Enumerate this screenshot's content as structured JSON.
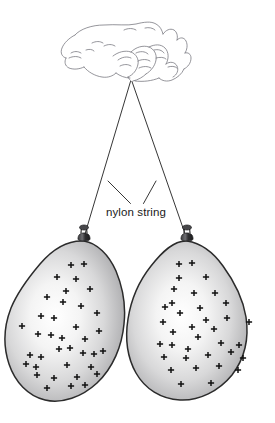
{
  "figure": {
    "name": "two-charged-balloons-hanging-from-hand",
    "background_color": "#ffffff",
    "width": 275,
    "height": 423,
    "annotation": {
      "label": "nylon string",
      "text_x": 106,
      "text_y": 216,
      "font_size": 11.5,
      "color": "#1a1a1a",
      "leader_lines": [
        {
          "x1": 108,
          "y1": 181,
          "x2": 130.5,
          "y2": 203.5
        },
        {
          "x1": 156,
          "y1": 181,
          "x2": 143.5,
          "y2": 203.5
        }
      ]
    },
    "hand": {
      "name": "hand-pinching-strings",
      "stroke_color": "#6e6e72",
      "stroke_width": 0.7,
      "pinch_point": {
        "x": 131,
        "y": 81
      }
    },
    "strings": {
      "name": "nylon-strings",
      "stroke_color": "#2b2b2b",
      "stroke_width": 0.9,
      "left": {
        "x1": 130.5,
        "y1": 81,
        "x2": 83,
        "y2": 239
      },
      "right": {
        "x1": 132,
        "y1": 81,
        "x2": 186,
        "y2": 238
      }
    },
    "balloons": [
      {
        "name": "balloon-left",
        "charge_sign": "+",
        "charge_count": 37,
        "outline_color": "#2b2b2b",
        "fill_light": "#fdfdfd",
        "fill_dark": "#8e8e90",
        "knot": {
          "x": 84,
          "y": 235
        },
        "center": {
          "x": 65,
          "y": 330
        },
        "charges": [
          [
            71,
            265
          ],
          [
            84,
            264
          ],
          [
            57,
            277
          ],
          [
            76,
            279
          ],
          [
            66,
            291
          ],
          [
            90,
            289
          ],
          [
            47,
            297
          ],
          [
            63,
            302
          ],
          [
            81,
            306
          ],
          [
            41,
            316
          ],
          [
            54,
            318
          ],
          [
            97,
            313
          ],
          [
            22,
            326
          ],
          [
            76,
            327
          ],
          [
            99,
            331
          ],
          [
            38,
            334
          ],
          [
            51,
            335
          ],
          [
            85,
            339
          ],
          [
            59,
            349
          ],
          [
            30,
            355
          ],
          [
            41,
            357
          ],
          [
            83,
            353
          ],
          [
            94,
            354
          ],
          [
            103,
            351
          ],
          [
            36,
            367
          ],
          [
            67,
            365
          ],
          [
            91,
            367
          ],
          [
            37,
            375
          ],
          [
            54,
            378
          ],
          [
            77,
            377
          ],
          [
            97,
            374
          ],
          [
            26,
            364
          ],
          [
            47,
            388
          ],
          [
            71,
            386
          ],
          [
            85,
            385
          ],
          [
            62,
            338
          ],
          [
            70,
            348
          ]
        ]
      },
      {
        "name": "balloon-right",
        "charge_sign": "+",
        "charge_count": 36,
        "outline_color": "#2b2b2b",
        "fill_light": "#fdfdfd",
        "fill_dark": "#8e8e90",
        "knot": {
          "x": 187,
          "y": 235
        },
        "center": {
          "x": 200,
          "y": 330
        },
        "charges": [
          [
            179,
            264
          ],
          [
            192,
            263
          ],
          [
            179,
            278
          ],
          [
            206,
            277
          ],
          [
            174,
            289
          ],
          [
            194,
            293
          ],
          [
            172,
            303
          ],
          [
            215,
            293
          ],
          [
            165,
            307
          ],
          [
            200,
            308
          ],
          [
            226,
            303
          ],
          [
            180,
            313
          ],
          [
            163,
            322
          ],
          [
            206,
            320
          ],
          [
            192,
            327
          ],
          [
            227,
            318
          ],
          [
            173,
            332
          ],
          [
            198,
            337
          ],
          [
            214,
            329
          ],
          [
            249,
            322
          ],
          [
            160,
            344
          ],
          [
            172,
            345
          ],
          [
            188,
            349
          ],
          [
            221,
            343
          ],
          [
            239,
            345
          ],
          [
            164,
            357
          ],
          [
            186,
            358
          ],
          [
            208,
            355
          ],
          [
            231,
            352
          ],
          [
            243,
            358
          ],
          [
            171,
            370
          ],
          [
            196,
            368
          ],
          [
            219,
            366
          ],
          [
            238,
            370
          ],
          [
            181,
            384
          ],
          [
            211,
            383
          ]
        ]
      }
    ]
  }
}
